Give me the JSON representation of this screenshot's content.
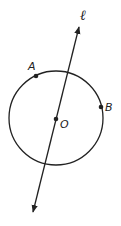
{
  "diagram": {
    "line_label": "ℓ",
    "center_label": "O",
    "points": [
      {
        "label": "A",
        "position": "upper-left on circle"
      },
      {
        "label": "B",
        "position": "right on circle"
      }
    ],
    "colors": {
      "stroke": "#222222",
      "background": "#ffffff"
    }
  }
}
